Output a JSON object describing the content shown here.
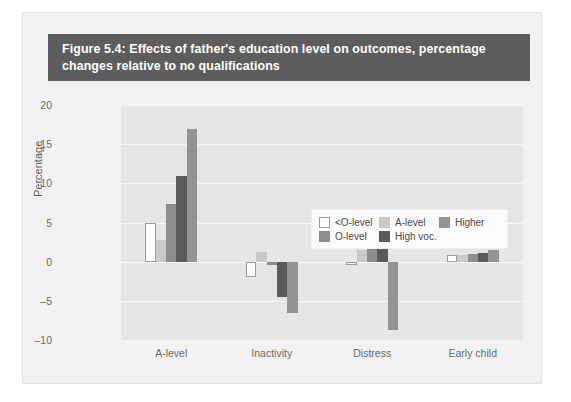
{
  "figure": {
    "title": "Figure 5.4: Effects of father's education level on outcomes, percentage changes relative to no qualifications"
  },
  "colors": {
    "title_bar_bg": "#5d5d5d",
    "title_text": "#ffffff",
    "figure_bg": "#f2f2f2",
    "plot_bg": "#e6e6e6",
    "gridline": "#f7f7f7",
    "axis_text": "#6a6a6a",
    "legend_bg": "#fbfbfb"
  },
  "chart_data": {
    "type": "bar",
    "title": "Figure 5.4: Effects of father's education level on outcomes, percentage changes relative to no qualifications",
    "xlabel": "",
    "ylabel": "Percentage",
    "ylim": [
      -10,
      20
    ],
    "yticks": [
      20,
      15,
      10,
      5,
      0,
      -5,
      -10
    ],
    "ytick_labels": [
      "20",
      "15",
      "10",
      "5",
      "0",
      "–5",
      "–10"
    ],
    "grid": true,
    "legend_position": "upper-center",
    "categories": [
      "A-level",
      "Inactivity",
      "Distress",
      "Early child"
    ],
    "series": [
      {
        "name": "<O-level",
        "color": "#ffffff",
        "border": "#9a9a9a",
        "values": [
          5.0,
          -2.0,
          -0.4,
          0.9
        ]
      },
      {
        "name": "A-level",
        "color": "#c9c9c9",
        "border": "#c9c9c9",
        "values": [
          2.8,
          1.2,
          1.5,
          0.8
        ]
      },
      {
        "name": "O-level",
        "color": "#8e8e8e",
        "border": "#8e8e8e",
        "values": [
          7.3,
          -0.4,
          2.8,
          1.0
        ]
      },
      {
        "name": "High voc.",
        "color": "#5a5a5a",
        "border": "#5a5a5a",
        "values": [
          11.0,
          -4.5,
          2.3,
          1.1
        ]
      },
      {
        "name": "Higher",
        "color": "#939393",
        "border": "#939393",
        "values": [
          17.0,
          -6.6,
          -8.7,
          1.5
        ]
      }
    ]
  }
}
